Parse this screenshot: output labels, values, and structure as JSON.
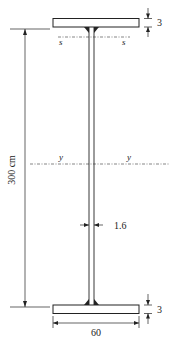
{
  "diagram": {
    "type": "welded I-beam cross-section (plate girder)",
    "labels": {
      "height": "300 cm",
      "web_thickness": "1.6",
      "flange_thickness_top": "3",
      "flange_thickness_bottom": "3",
      "flange_width": "60",
      "axis_s_left": "s",
      "axis_s_right": "s",
      "axis_y_left": "y",
      "axis_y_right": "y"
    },
    "colors": {
      "stroke": "#222222",
      "background": "#ffffff"
    }
  }
}
